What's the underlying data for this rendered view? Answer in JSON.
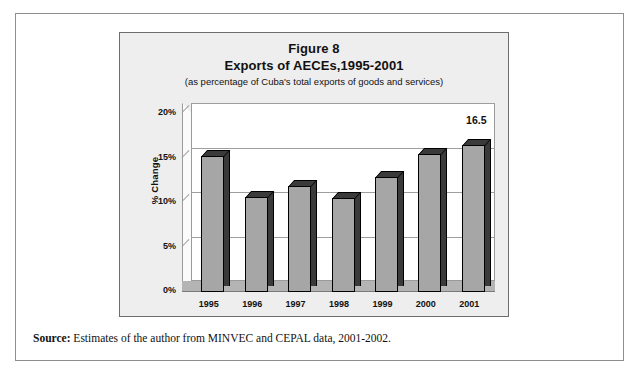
{
  "figure": {
    "title_line1": "Figure 8",
    "title_line2": "Exports of AECEs,1995-2001",
    "subtitle": "(as percentage of Cuba's total exports of goods and services)",
    "y_axis_title": "% Change"
  },
  "source": {
    "label": "Source:",
    "text": " Estimates of the author from MINVEC and CEPAL data, 2001-2002."
  },
  "colors": {
    "bar_fill": "#a6a6a6",
    "bar_outline": "#000000",
    "bar_side": "#3a3a3a",
    "floor": "#b4b4b4",
    "box_background": "#eeeeee",
    "plot_background": "#ffffff",
    "gridline": "#9e9e9e"
  },
  "chart_data": {
    "type": "bar",
    "subtitle": "(as percentage of Cuba's total exports of goods and services)",
    "xlabel": "",
    "ylabel": "% Change",
    "ylim": [
      0,
      20
    ],
    "ytick_labels": [
      "0%",
      "5%",
      "10%",
      "15%",
      "20%"
    ],
    "ytick_values": [
      0,
      5,
      10,
      15,
      20
    ],
    "grid": true,
    "legend": false,
    "style": "3d-column",
    "categories": [
      "1995",
      "1996",
      "1997",
      "1998",
      "1999",
      "2000",
      "2001"
    ],
    "values": [
      15.3,
      10.7,
      11.9,
      10.6,
      12.9,
      15.5,
      16.5
    ],
    "data_labels": [
      null,
      null,
      null,
      null,
      null,
      null,
      "16.5"
    ]
  }
}
